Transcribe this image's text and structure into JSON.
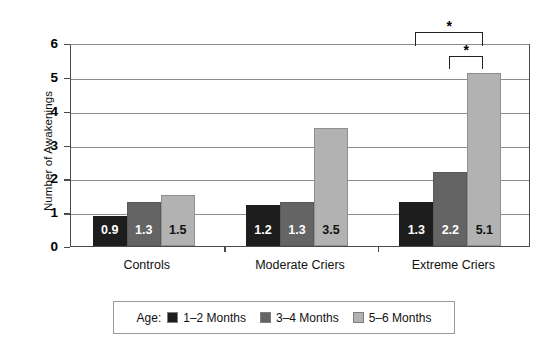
{
  "chart_data": {
    "type": "bar",
    "title": "",
    "xlabel": "",
    "ylabel": "Number of Awakenings",
    "ylim": [
      0,
      6
    ],
    "ytick_labels": [
      "0",
      "1",
      "2",
      "3",
      "4",
      "5",
      "6"
    ],
    "yticks": [
      0,
      1,
      2,
      3,
      4,
      5,
      6
    ],
    "grid": true,
    "legend_position": "bottom",
    "legend_title": "Age:",
    "categories": [
      "Controls",
      "Moderate Criers",
      "Extreme Criers"
    ],
    "series": [
      {
        "name": "1–2 Months",
        "color": "#1d1d1d",
        "values": [
          0.9,
          1.2,
          1.3
        ],
        "labels": [
          "0.9",
          "1.2",
          "1.3"
        ]
      },
      {
        "name": "3–4 Months",
        "color": "#646464",
        "values": [
          1.3,
          1.3,
          2.2
        ],
        "labels": [
          "1.3",
          "1.3",
          "2.2"
        ]
      },
      {
        "name": "5–6 Months",
        "color": "#b2b2b2",
        "values": [
          1.5,
          3.5,
          5.1
        ],
        "labels": [
          "1.5",
          "3.5",
          "5.1"
        ]
      }
    ],
    "annotations": [
      {
        "id": "sig-1",
        "symbol": "*",
        "from_category": "Extreme Criers",
        "from_series": "1–2 Months",
        "to_series": "5–6 Months"
      },
      {
        "id": "sig-2",
        "symbol": "*",
        "from_category": "Extreme Criers",
        "from_series": "3–4 Months",
        "to_series": "5–6 Months"
      }
    ]
  }
}
